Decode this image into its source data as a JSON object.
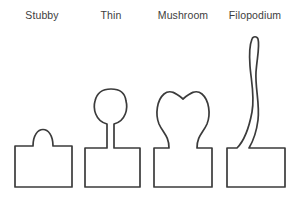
{
  "figure": {
    "background_color": "#ffffff",
    "stroke_color": "#3b3b3b",
    "label_color": "#3d3d3d",
    "stroke_width": 1.7,
    "width": 300,
    "height": 206
  },
  "spines": [
    {
      "id": "stubby",
      "label": "Stubby",
      "label_x": 42,
      "label_y": 19,
      "description": "Wide rectangular dendrite base with a small low rounded bump on top; no distinct neck.",
      "base": {
        "x": 15,
        "y": 146,
        "width": 57,
        "height": 41
      },
      "head": {
        "shape": "low-rounded-bump",
        "x_left": 33,
        "x_right": 53,
        "top_y": 122
      },
      "neck": {
        "present": false,
        "width": 20
      },
      "total_height": 65,
      "path": "M15 187 L15 146 L33 146 C33 124 53 124 53 146 L72 146 L72 187 Z"
    },
    {
      "id": "thin",
      "label": "Thin",
      "label_x": 111,
      "label_y": 19,
      "description": "Rectangular base with a long slender neck rising to a small rounded bulb head.",
      "base": {
        "x": 85,
        "y": 148,
        "width": 55,
        "height": 39
      },
      "head": {
        "shape": "small-round-bulb",
        "x_left": 95,
        "x_right": 126,
        "top_y": 90
      },
      "neck": {
        "present": true,
        "width": 7,
        "top_y": 120,
        "bottom_y": 148
      },
      "total_height": 97,
      "path": "M85 187 L85 148 L107 148 L107 124 C95 121 93 108 95 101 C97 92 104 89 111 89 C118 89 125 92 126 101 C128 108 126 121 114 124 L114 148 L140 148 L140 187 Z"
    },
    {
      "id": "mushroom",
      "label": "Mushroom",
      "label_x": 183,
      "label_y": 19,
      "description": "Rectangular base with a short constricted neck expanding into a wide bulbous head that dips slightly in the centre of its top.",
      "base": {
        "x": 154,
        "y": 148,
        "width": 58,
        "height": 39
      },
      "head": {
        "shape": "wide-bulb-with-center-dip",
        "x_left": 158,
        "x_right": 210,
        "top_y": 90
      },
      "neck": {
        "present": true,
        "width": 14,
        "top_y": 126,
        "bottom_y": 148
      },
      "total_height": 97,
      "path": "M154 187 L154 148 L169 148 C169 136 163 133 159 124 C155 114 157 100 164 94 C170 89 176 93 183 99 C190 93 196 89 202 94 C209 100 211 114 207 124 C203 133 197 136 197 148 L212 148 L212 187 Z"
    },
    {
      "id": "filopodium",
      "label": "Filopodium",
      "label_x": 255,
      "label_y": 19,
      "description": "Rectangular base with a very long, thin, wavy sinuous protrusion that curves in an S-shape and ends in a rounded tip far above the base.",
      "base": {
        "x": 227,
        "y": 148,
        "width": 58,
        "height": 39
      },
      "head": {
        "shape": "rounded-tip",
        "x_left": 249,
        "x_right": 257,
        "top_y": 37
      },
      "neck": {
        "present": true,
        "width": 8,
        "top_y": 37,
        "bottom_y": 148,
        "profile": "wavy"
      },
      "total_height": 150,
      "path": "M227 187 L227 148 L237 148 C244 141 249 128 252 112 C255 96 251 80 250 66 C249 53 250 44 252 39 C253 36 257 36 258 39 C260 46 257 58 256 72 C255 88 260 104 258 120 C256 136 252 143 249 148 L285 148 L285 187 Z"
    }
  ]
}
